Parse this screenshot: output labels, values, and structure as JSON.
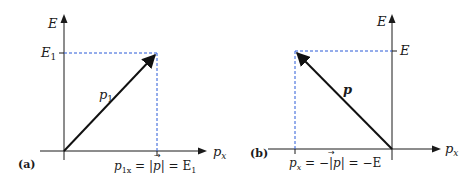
{
  "panels": [
    {
      "id": "a",
      "tag": "(a)",
      "y_axis_label": "E",
      "x_axis_label": "p",
      "x_axis_sub": "x",
      "y_tick_label": "E",
      "y_tick_sub": "1",
      "vector_label": "p",
      "vector_sub": "1",
      "x_tick_label_parts": {
        "p": "p",
        "sub": "1x",
        "eq1": " = |",
        "vec": "p",
        "eq2": "| = E",
        "end_sub": "1"
      }
    },
    {
      "id": "b",
      "tag": "(b)",
      "y_axis_label": "E",
      "x_axis_label": "p",
      "x_axis_sub": "x",
      "y_tick_label": "E",
      "vector_label": "p",
      "x_tick_label_parts": {
        "p": "p",
        "sub": "x",
        "eq1": " = −|",
        "vec": "p",
        "eq2": "| = −E"
      }
    }
  ],
  "colors": {
    "axis": "#1a1a1a",
    "dashed_guides": "#2a5bd7",
    "vector": "#111111"
  }
}
